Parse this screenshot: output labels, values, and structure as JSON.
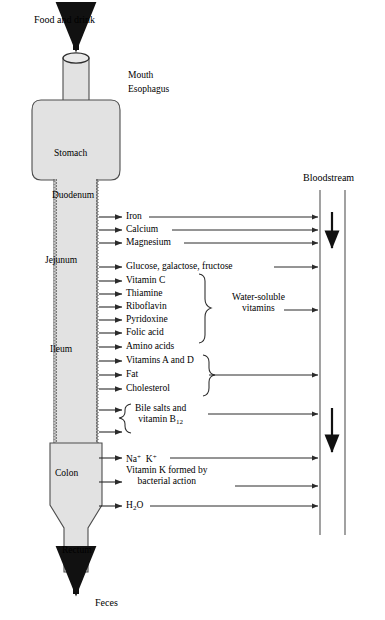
{
  "diagram": {
    "input_label": "Food and drink",
    "output_label": "Feces",
    "bloodstream_label": "Bloodstream",
    "fill_color": "#e2e2e2",
    "stroke_color": "#4d4d4d",
    "text_color": "#000000"
  },
  "organs": [
    {
      "name": "Mouth",
      "x": 128,
      "y": 70
    },
    {
      "name": "Esophagus",
      "x": 128,
      "y": 84
    },
    {
      "name": "Stomach",
      "x": 54,
      "y": 148
    },
    {
      "name": "Duodenum",
      "x": 52,
      "y": 190
    },
    {
      "name": "Jejunum",
      "x": 45,
      "y": 255
    },
    {
      "name": "Ileum",
      "x": 50,
      "y": 344
    },
    {
      "name": "Colon",
      "x": 55,
      "y": 468
    },
    {
      "name": "Rectum",
      "x": 62,
      "y": 545
    }
  ],
  "absorption_rows": [
    {
      "label": "Iron",
      "y": 217,
      "direct": true
    },
    {
      "label": "Calcium",
      "y": 230,
      "direct": true
    },
    {
      "label": "Magnesium",
      "y": 243,
      "direct": true
    },
    {
      "label": "Glucose, galactose, fructose",
      "y": 267,
      "direct": true
    },
    {
      "label": "Vitamin C",
      "y": 281,
      "direct": false
    },
    {
      "label": "Thiamine",
      "y": 294,
      "direct": false
    },
    {
      "label": "Riboflavin",
      "y": 307,
      "direct": false
    },
    {
      "label": "Pyridoxine",
      "y": 320,
      "direct": false
    },
    {
      "label": "Folic acid",
      "y": 333,
      "direct": false
    },
    {
      "label": "Amino acids",
      "y": 347,
      "direct": true
    },
    {
      "label": "Vitamins A and D",
      "y": 361,
      "direct": false
    },
    {
      "label": "Fat",
      "y": 375,
      "direct": false
    },
    {
      "label": "Cholesterol",
      "y": 389,
      "direct": false
    },
    {
      "label": "Na<sup>+</sup>&nbsp; K<sup>+</sup>",
      "y": 458,
      "direct": true
    },
    {
      "label": "H<sub>2</sub>O",
      "y": 506,
      "direct": true
    }
  ],
  "grouped_labels": [
    {
      "label": "Water-soluble<br>vitamins",
      "x": 232,
      "y": 303
    },
    {
      "label": "Bile salts and<br>vitamin B<sub>12</sub>",
      "x": 135,
      "y": 414
    },
    {
      "label": "Vitamin K formed by<br>bacterial action",
      "x": 126,
      "y": 476
    }
  ]
}
